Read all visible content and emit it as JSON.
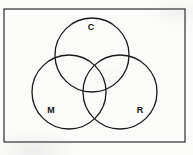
{
  "figure": {
    "type": "venn-diagram-3-set",
    "title": "",
    "border": {
      "shape": "rectangle",
      "x": 4,
      "y": 9,
      "width": 181,
      "height": 133,
      "stroke_color": "#1a1a1a",
      "stroke_width": 1.1,
      "fill": "none"
    },
    "stroke_color": "#1a1a1a",
    "stroke_width": 1.3,
    "fill": "none",
    "background_color": "#fbfbfa",
    "circles": [
      {
        "id": "C",
        "label": "C",
        "cx": 92,
        "cy": 55,
        "r": 37,
        "label_x": 91,
        "label_y": 28
      },
      {
        "id": "M",
        "label": "M",
        "cx": 69,
        "cy": 92,
        "r": 37,
        "label_x": 51,
        "label_y": 111
      },
      {
        "id": "R",
        "label": "R",
        "cx": 120,
        "cy": 92,
        "r": 37,
        "label_x": 140,
        "label_y": 111
      }
    ]
  }
}
